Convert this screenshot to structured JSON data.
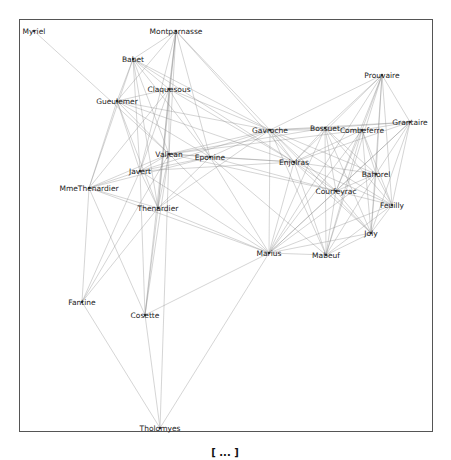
{
  "graph": {
    "nodes": [
      {
        "id": "Myriel",
        "x": 34,
        "y": 31
      },
      {
        "id": "Montparnasse",
        "x": 176,
        "y": 31
      },
      {
        "id": "Babet",
        "x": 133,
        "y": 59
      },
      {
        "id": "Claquesous",
        "x": 169,
        "y": 89
      },
      {
        "id": "Gueulemer",
        "x": 117,
        "y": 101
      },
      {
        "id": "Valjean",
        "x": 169,
        "y": 154
      },
      {
        "id": "Eponine",
        "x": 210,
        "y": 157
      },
      {
        "id": "Javert",
        "x": 140,
        "y": 171
      },
      {
        "id": "MmeThenardier",
        "x": 89,
        "y": 188
      },
      {
        "id": "Thenardier",
        "x": 158,
        "y": 208
      },
      {
        "id": "Prouvaire",
        "x": 382,
        "y": 75
      },
      {
        "id": "Gavroche",
        "x": 270,
        "y": 130
      },
      {
        "id": "Bossuet",
        "x": 325,
        "y": 128
      },
      {
        "id": "Combeferre",
        "x": 362,
        "y": 130
      },
      {
        "id": "Grantaire",
        "x": 410,
        "y": 122
      },
      {
        "id": "Enjolras",
        "x": 294,
        "y": 162
      },
      {
        "id": "Bahorel",
        "x": 376,
        "y": 174
      },
      {
        "id": "Courfeyrac",
        "x": 336,
        "y": 191
      },
      {
        "id": "Feuilly",
        "x": 392,
        "y": 205
      },
      {
        "id": "Joly",
        "x": 371,
        "y": 233
      },
      {
        "id": "Marius",
        "x": 269,
        "y": 253
      },
      {
        "id": "Mabeuf",
        "x": 326,
        "y": 255
      },
      {
        "id": "Fantine",
        "x": 82,
        "y": 302
      },
      {
        "id": "Cosette",
        "x": 145,
        "y": 315
      },
      {
        "id": "Tholomyes",
        "x": 160,
        "y": 428
      }
    ],
    "edges": [
      [
        "Myriel",
        "Valjean"
      ],
      [
        "Montparnasse",
        "Babet"
      ],
      [
        "Montparnasse",
        "Gueulemer"
      ],
      [
        "Montparnasse",
        "Claquesous"
      ],
      [
        "Montparnasse",
        "Valjean"
      ],
      [
        "Montparnasse",
        "Javert"
      ],
      [
        "Montparnasse",
        "Thenardier"
      ],
      [
        "Montparnasse",
        "Eponine"
      ],
      [
        "Montparnasse",
        "Gavroche"
      ],
      [
        "Montparnasse",
        "Enjolras"
      ],
      [
        "Montparnasse",
        "Cosette"
      ],
      [
        "Babet",
        "Gueulemer"
      ],
      [
        "Babet",
        "Claquesous"
      ],
      [
        "Babet",
        "Valjean"
      ],
      [
        "Babet",
        "Javert"
      ],
      [
        "Babet",
        "Thenardier"
      ],
      [
        "Babet",
        "MmeThenardier"
      ],
      [
        "Babet",
        "Eponine"
      ],
      [
        "Babet",
        "Gavroche"
      ],
      [
        "Babet",
        "Enjolras"
      ],
      [
        "Claquesous",
        "Gueulemer"
      ],
      [
        "Claquesous",
        "Valjean"
      ],
      [
        "Claquesous",
        "Javert"
      ],
      [
        "Claquesous",
        "Thenardier"
      ],
      [
        "Claquesous",
        "MmeThenardier"
      ],
      [
        "Claquesous",
        "Eponine"
      ],
      [
        "Claquesous",
        "Enjolras"
      ],
      [
        "Claquesous",
        "Gavroche"
      ],
      [
        "Gueulemer",
        "Valjean"
      ],
      [
        "Gueulemer",
        "Javert"
      ],
      [
        "Gueulemer",
        "Thenardier"
      ],
      [
        "Gueulemer",
        "MmeThenardier"
      ],
      [
        "Gueulemer",
        "Eponine"
      ],
      [
        "Gueulemer",
        "Gavroche"
      ],
      [
        "Gueulemer",
        "Enjolras"
      ],
      [
        "Valjean",
        "Javert"
      ],
      [
        "Valjean",
        "Thenardier"
      ],
      [
        "Valjean",
        "MmeThenardier"
      ],
      [
        "Valjean",
        "Eponine"
      ],
      [
        "Valjean",
        "Marius"
      ],
      [
        "Valjean",
        "Cosette"
      ],
      [
        "Valjean",
        "Fantine"
      ],
      [
        "Valjean",
        "Gavroche"
      ],
      [
        "Valjean",
        "Enjolras"
      ],
      [
        "Valjean",
        "Bossuet"
      ],
      [
        "Valjean",
        "Combeferre"
      ],
      [
        "Valjean",
        "Courfeyrac"
      ],
      [
        "Valjean",
        "Tholomyes"
      ],
      [
        "Javert",
        "Thenardier"
      ],
      [
        "Javert",
        "MmeThenardier"
      ],
      [
        "Javert",
        "Fantine"
      ],
      [
        "Javert",
        "Cosette"
      ],
      [
        "Javert",
        "Gavroche"
      ],
      [
        "Javert",
        "Enjolras"
      ],
      [
        "Javert",
        "Eponine"
      ],
      [
        "Javert",
        "Marius"
      ],
      [
        "Thenardier",
        "MmeThenardier"
      ],
      [
        "Thenardier",
        "Eponine"
      ],
      [
        "Thenardier",
        "Fantine"
      ],
      [
        "Thenardier",
        "Cosette"
      ],
      [
        "Thenardier",
        "Marius"
      ],
      [
        "Thenardier",
        "Gavroche"
      ],
      [
        "MmeThenardier",
        "Fantine"
      ],
      [
        "MmeThenardier",
        "Cosette"
      ],
      [
        "MmeThenardier",
        "Eponine"
      ],
      [
        "MmeThenardier",
        "Marius"
      ],
      [
        "Eponine",
        "Marius"
      ],
      [
        "Eponine",
        "Gavroche"
      ],
      [
        "Eponine",
        "Courfeyrac"
      ],
      [
        "Eponine",
        "Enjolras"
      ],
      [
        "Eponine",
        "Mabeuf"
      ],
      [
        "Marius",
        "Cosette"
      ],
      [
        "Marius",
        "Tholomyes"
      ],
      [
        "Marius",
        "Gavroche"
      ],
      [
        "Marius",
        "Enjolras"
      ],
      [
        "Marius",
        "Bossuet"
      ],
      [
        "Marius",
        "Combeferre"
      ],
      [
        "Marius",
        "Courfeyrac"
      ],
      [
        "Marius",
        "Bahorel"
      ],
      [
        "Marius",
        "Feuilly"
      ],
      [
        "Marius",
        "Joly"
      ],
      [
        "Marius",
        "Mabeuf"
      ],
      [
        "Marius",
        "Prouvaire"
      ],
      [
        "Marius",
        "Grantaire"
      ],
      [
        "Fantine",
        "Tholomyes"
      ],
      [
        "Cosette",
        "Tholomyes"
      ],
      [
        "Gavroche",
        "Bossuet"
      ],
      [
        "Gavroche",
        "Combeferre"
      ],
      [
        "Gavroche",
        "Grantaire"
      ],
      [
        "Gavroche",
        "Enjolras"
      ],
      [
        "Gavroche",
        "Bahorel"
      ],
      [
        "Gavroche",
        "Courfeyrac"
      ],
      [
        "Gavroche",
        "Feuilly"
      ],
      [
        "Gavroche",
        "Joly"
      ],
      [
        "Gavroche",
        "Mabeuf"
      ],
      [
        "Gavroche",
        "Prouvaire"
      ],
      [
        "Bossuet",
        "Combeferre"
      ],
      [
        "Bossuet",
        "Grantaire"
      ],
      [
        "Bossuet",
        "Enjolras"
      ],
      [
        "Bossuet",
        "Bahorel"
      ],
      [
        "Bossuet",
        "Courfeyrac"
      ],
      [
        "Bossuet",
        "Feuilly"
      ],
      [
        "Bossuet",
        "Joly"
      ],
      [
        "Bossuet",
        "Mabeuf"
      ],
      [
        "Bossuet",
        "Prouvaire"
      ],
      [
        "Combeferre",
        "Grantaire"
      ],
      [
        "Combeferre",
        "Enjolras"
      ],
      [
        "Combeferre",
        "Bahorel"
      ],
      [
        "Combeferre",
        "Courfeyrac"
      ],
      [
        "Combeferre",
        "Feuilly"
      ],
      [
        "Combeferre",
        "Joly"
      ],
      [
        "Combeferre",
        "Mabeuf"
      ],
      [
        "Combeferre",
        "Prouvaire"
      ],
      [
        "Grantaire",
        "Enjolras"
      ],
      [
        "Grantaire",
        "Bahorel"
      ],
      [
        "Grantaire",
        "Courfeyrac"
      ],
      [
        "Grantaire",
        "Feuilly"
      ],
      [
        "Grantaire",
        "Joly"
      ],
      [
        "Grantaire",
        "Prouvaire"
      ],
      [
        "Enjolras",
        "Bahorel"
      ],
      [
        "Enjolras",
        "Courfeyrac"
      ],
      [
        "Enjolras",
        "Feuilly"
      ],
      [
        "Enjolras",
        "Joly"
      ],
      [
        "Enjolras",
        "Mabeuf"
      ],
      [
        "Enjolras",
        "Prouvaire"
      ],
      [
        "Bahorel",
        "Courfeyrac"
      ],
      [
        "Bahorel",
        "Feuilly"
      ],
      [
        "Bahorel",
        "Joly"
      ],
      [
        "Bahorel",
        "Mabeuf"
      ],
      [
        "Bahorel",
        "Prouvaire"
      ],
      [
        "Courfeyrac",
        "Feuilly"
      ],
      [
        "Courfeyrac",
        "Joly"
      ],
      [
        "Courfeyrac",
        "Mabeuf"
      ],
      [
        "Courfeyrac",
        "Prouvaire"
      ],
      [
        "Feuilly",
        "Joly"
      ],
      [
        "Feuilly",
        "Mabeuf"
      ],
      [
        "Feuilly",
        "Prouvaire"
      ],
      [
        "Joly",
        "Mabeuf"
      ],
      [
        "Joly",
        "Prouvaire"
      ],
      [
        "Mabeuf",
        "Prouvaire"
      ]
    ]
  },
  "caption": "[ ... ]"
}
